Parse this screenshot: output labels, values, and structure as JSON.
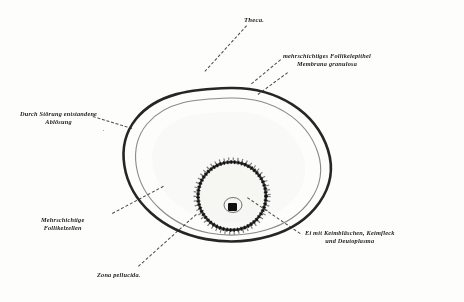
{
  "figure": {
    "background_color": "#fdfdfc",
    "ink_color": "#1b1b1b",
    "style": "lithograph-halftone"
  },
  "labels": [
    {
      "id": "theca",
      "name": "label-theca",
      "text": "Theca.",
      "x": 244,
      "y": 16,
      "size": "sz-md",
      "align": "left"
    },
    {
      "id": "follikelepithel",
      "name": "label-follikelepithel",
      "line1": "mehrschichtiges Follikelepithel",
      "line2": "Membrana granulosa",
      "x": 283,
      "y": 52,
      "size": "sz-sm",
      "align": "left"
    },
    {
      "id": "abloesung",
      "name": "label-abloesung",
      "line1": "Durch Störung entstandene",
      "line2": "Ablösung",
      "x": 20,
      "y": 110,
      "size": "sz-sm",
      "align": "center"
    },
    {
      "id": "follikelzellen",
      "name": "label-follikelzellen",
      "line1": "Mehrschichtige",
      "line2": "Follikelzellen",
      "x": 41,
      "y": 216,
      "size": "sz-sm",
      "align": "center"
    },
    {
      "id": "ei",
      "name": "label-ei",
      "line1": "Ei mit Keimbläschen, Keimfleck",
      "line2": "und Deutoplasma",
      "x": 305,
      "y": 229,
      "size": "sz-sm",
      "align": "center"
    },
    {
      "id": "zona",
      "name": "label-zona-pellucida",
      "text": "Zona pellucida.",
      "x": 97,
      "y": 271,
      "size": "sz-sm",
      "align": "left"
    }
  ],
  "leaders": [
    {
      "id": "leader-theca",
      "name": "leader-line-theca",
      "x1": 247,
      "y1": 26,
      "x2": 205,
      "y2": 72
    },
    {
      "id": "leader-epithel",
      "name": "leader-line-follikelepithel",
      "x1": 281,
      "y1": 60,
      "x2": 252,
      "y2": 84
    },
    {
      "id": "leader-granulosa",
      "name": "leader-line-granulosa",
      "x1": 288,
      "y1": 73,
      "x2": 258,
      "y2": 95
    },
    {
      "id": "leader-abloesung",
      "name": "leader-line-abloesung",
      "x1": 93,
      "y1": 116,
      "x2": 132,
      "y2": 128
    },
    {
      "id": "leader-follikelzellen",
      "name": "leader-line-follikelzellen",
      "x1": 112,
      "y1": 213,
      "x2": 163,
      "y2": 186
    },
    {
      "id": "leader-ei",
      "name": "leader-line-ei",
      "x1": 300,
      "y1": 234,
      "x2": 247,
      "y2": 198
    },
    {
      "id": "leader-zona",
      "name": "leader-line-zona",
      "x1": 138,
      "y1": 266,
      "x2": 196,
      "y2": 214
    }
  ],
  "structures": {
    "theca_outer": {
      "name": "theca-externa-layer",
      "note": "stippled outer connective sheath"
    },
    "theca_inner": {
      "name": "theca-interna-layer",
      "note": "dense granular band"
    },
    "granulosa_ring": {
      "name": "membrana-granulosa",
      "note": "dark multilayered follicular epithelium ring"
    },
    "antrum": {
      "name": "follicular-antrum",
      "note": "pale liquor folliculi cavity"
    },
    "cumulus": {
      "name": "cumulus-oophorus",
      "note": "cell mound surrounding the ovum"
    },
    "ovum": {
      "name": "ovum-body",
      "note": "deutoplasm-filled egg cell"
    },
    "zona_pellucida": {
      "name": "zona-pellucida-ring",
      "note": "thin refractile envelope"
    },
    "germinal_vesicle": {
      "name": "germinal-vesicle",
      "note": "Keimbläschen / nucleus"
    },
    "germinal_spot": {
      "name": "germinal-spot",
      "note": "Keimfleck / nucleolus"
    },
    "detachment": {
      "name": "detachment-gap",
      "note": "artifactual separation of theca"
    }
  }
}
